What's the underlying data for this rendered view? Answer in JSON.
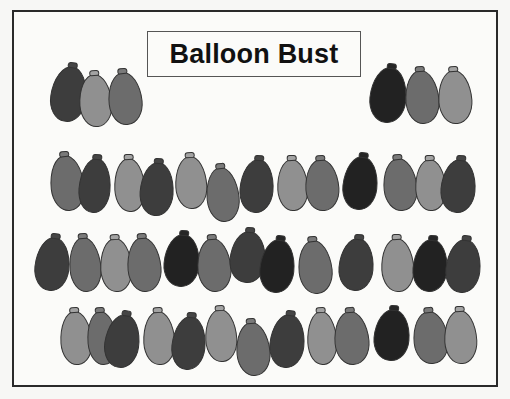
{
  "game": {
    "title": "Balloon Bust"
  },
  "shades": {
    "black": "#262626",
    "dark": "#454545",
    "medium": "#7a7a7a",
    "light": "#a3a3a3"
  },
  "balloons": [
    {
      "id": "t1",
      "x": 51,
      "y": 62,
      "w": 36,
      "h": 60,
      "shade": "dark",
      "rot": 8
    },
    {
      "id": "t2",
      "x": 79,
      "y": 70,
      "w": 33,
      "h": 57,
      "shade": "light",
      "rot": -4
    },
    {
      "id": "t3",
      "x": 108,
      "y": 68,
      "w": 34,
      "h": 57,
      "shade": "medium",
      "rot": -6
    },
    {
      "id": "t4",
      "x": 370,
      "y": 63,
      "w": 37,
      "h": 60,
      "shade": "black",
      "rot": 6
    },
    {
      "id": "t5",
      "x": 405,
      "y": 66,
      "w": 34,
      "h": 58,
      "shade": "medium",
      "rot": -5
    },
    {
      "id": "t6",
      "x": 438,
      "y": 66,
      "w": 34,
      "h": 58,
      "shade": "light",
      "rot": -4
    },
    {
      "id": "r1-1",
      "x": 50,
      "y": 151,
      "w": 34,
      "h": 60,
      "shade": "medium",
      "rot": -6
    },
    {
      "id": "r1-2",
      "x": 79,
      "y": 154,
      "w": 32,
      "h": 59,
      "shade": "dark",
      "rot": 5
    },
    {
      "id": "r1-3",
      "x": 114,
      "y": 154,
      "w": 31,
      "h": 58,
      "shade": "light",
      "rot": -3
    },
    {
      "id": "r1-4",
      "x": 140,
      "y": 158,
      "w": 34,
      "h": 58,
      "shade": "dark",
      "rot": 4
    },
    {
      "id": "r1-5",
      "x": 175,
      "y": 152,
      "w": 32,
      "h": 57,
      "shade": "light",
      "rot": -3
    },
    {
      "id": "r1-6",
      "x": 206,
      "y": 163,
      "w": 33,
      "h": 59,
      "shade": "medium",
      "rot": -6
    },
    {
      "id": "r1-7",
      "x": 240,
      "y": 155,
      "w": 34,
      "h": 58,
      "shade": "dark",
      "rot": 5
    },
    {
      "id": "r1-8",
      "x": 277,
      "y": 155,
      "w": 31,
      "h": 56,
      "shade": "light",
      "rot": -3
    },
    {
      "id": "r1-9",
      "x": 305,
      "y": 155,
      "w": 34,
      "h": 56,
      "shade": "medium",
      "rot": -4
    },
    {
      "id": "r1-10",
      "x": 343,
      "y": 152,
      "w": 35,
      "h": 58,
      "shade": "black",
      "rot": 6
    },
    {
      "id": "r1-11",
      "x": 383,
      "y": 154,
      "w": 34,
      "h": 57,
      "shade": "medium",
      "rot": -6
    },
    {
      "id": "r1-12",
      "x": 415,
      "y": 155,
      "w": 31,
      "h": 56,
      "shade": "light",
      "rot": -3
    },
    {
      "id": "r1-13",
      "x": 441,
      "y": 155,
      "w": 35,
      "h": 58,
      "shade": "dark",
      "rot": 5
    },
    {
      "id": "r2-1",
      "x": 35,
      "y": 233,
      "w": 35,
      "h": 58,
      "shade": "dark",
      "rot": 6
    },
    {
      "id": "r2-2",
      "x": 69,
      "y": 233,
      "w": 32,
      "h": 59,
      "shade": "medium",
      "rot": -5
    },
    {
      "id": "r2-3",
      "x": 100,
      "y": 234,
      "w": 32,
      "h": 58,
      "shade": "light",
      "rot": -3
    },
    {
      "id": "r2-4",
      "x": 127,
      "y": 233,
      "w": 34,
      "h": 59,
      "shade": "medium",
      "rot": -5
    },
    {
      "id": "r2-5",
      "x": 164,
      "y": 230,
      "w": 36,
      "h": 57,
      "shade": "black",
      "rot": 5
    },
    {
      "id": "r2-6",
      "x": 197,
      "y": 234,
      "w": 34,
      "h": 58,
      "shade": "medium",
      "rot": -5
    },
    {
      "id": "r2-7",
      "x": 230,
      "y": 227,
      "w": 36,
      "h": 56,
      "shade": "dark",
      "rot": 5
    },
    {
      "id": "r2-8",
      "x": 260,
      "y": 235,
      "w": 35,
      "h": 58,
      "shade": "black",
      "rot": 6
    },
    {
      "id": "r2-9",
      "x": 298,
      "y": 236,
      "w": 34,
      "h": 58,
      "shade": "medium",
      "rot": -6
    },
    {
      "id": "r2-10",
      "x": 339,
      "y": 234,
      "w": 35,
      "h": 57,
      "shade": "dark",
      "rot": 5
    },
    {
      "id": "r2-11",
      "x": 381,
      "y": 234,
      "w": 33,
      "h": 58,
      "shade": "light",
      "rot": -3
    },
    {
      "id": "r2-12",
      "x": 413,
      "y": 235,
      "w": 35,
      "h": 57,
      "shade": "black",
      "rot": 5
    },
    {
      "id": "r2-13",
      "x": 446,
      "y": 235,
      "w": 35,
      "h": 58,
      "shade": "dark",
      "rot": 6
    },
    {
      "id": "r3-1",
      "x": 60,
      "y": 307,
      "w": 32,
      "h": 58,
      "shade": "light",
      "rot": -4
    },
    {
      "id": "r3-2",
      "x": 87,
      "y": 307,
      "w": 30,
      "h": 58,
      "shade": "medium",
      "rot": -5
    },
    {
      "id": "r3-3",
      "x": 105,
      "y": 310,
      "w": 35,
      "h": 58,
      "shade": "dark",
      "rot": 8
    },
    {
      "id": "r3-4",
      "x": 143,
      "y": 307,
      "w": 32,
      "h": 58,
      "shade": "light",
      "rot": -3
    },
    {
      "id": "r3-5",
      "x": 172,
      "y": 312,
      "w": 34,
      "h": 58,
      "shade": "dark",
      "rot": 6
    },
    {
      "id": "r3-6",
      "x": 205,
      "y": 305,
      "w": 32,
      "h": 57,
      "shade": "light",
      "rot": -3
    },
    {
      "id": "r3-7",
      "x": 236,
      "y": 318,
      "w": 34,
      "h": 58,
      "shade": "medium",
      "rot": -5
    },
    {
      "id": "r3-8",
      "x": 270,
      "y": 310,
      "w": 35,
      "h": 58,
      "shade": "dark",
      "rot": 6
    },
    {
      "id": "r3-9",
      "x": 307,
      "y": 307,
      "w": 30,
      "h": 58,
      "shade": "light",
      "rot": -3
    },
    {
      "id": "r3-10",
      "x": 334,
      "y": 307,
      "w": 35,
      "h": 58,
      "shade": "medium",
      "rot": -5
    },
    {
      "id": "r3-11",
      "x": 374,
      "y": 305,
      "w": 36,
      "h": 56,
      "shade": "black",
      "rot": 5
    },
    {
      "id": "r3-12",
      "x": 413,
      "y": 307,
      "w": 35,
      "h": 57,
      "shade": "medium",
      "rot": -6
    },
    {
      "id": "r3-13",
      "x": 444,
      "y": 306,
      "w": 33,
      "h": 58,
      "shade": "light",
      "rot": -3
    }
  ]
}
